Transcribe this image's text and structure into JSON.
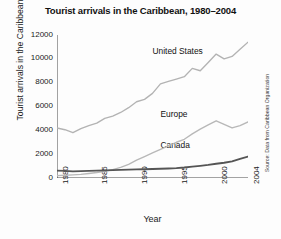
{
  "chart_data": {
    "type": "line",
    "title": "Tourist arrivals in the Caribbean, 1980–2004",
    "xlabel": "Year",
    "ylabel": "Tourist arrivals in the Caribbean",
    "source": "Source: Data from Caribbean Organization",
    "grid": false,
    "legend_position": "inline-labels",
    "xlim": [
      1980,
      2004
    ],
    "ylim": [
      0,
      12000
    ],
    "ytick_values": [
      0,
      2000,
      4000,
      6000,
      8000,
      10000,
      12000
    ],
    "ytick_labels": [
      "0",
      "2000",
      "4000",
      "6000",
      "8000",
      "10000",
      "12000"
    ],
    "xtick_labels": [
      "1980",
      "1985",
      "1990",
      "1995",
      "2000",
      "2004"
    ],
    "xtick_values": [
      1980,
      1985,
      1990,
      1995,
      2000,
      2004
    ],
    "x": [
      1980,
      1981,
      1982,
      1983,
      1984,
      1985,
      1986,
      1987,
      1988,
      1989,
      1990,
      1991,
      1992,
      1993,
      1994,
      1995,
      1996,
      1997,
      1998,
      1999,
      2000,
      2001,
      2002,
      2003,
      2004
    ],
    "series": [
      {
        "name": "United States",
        "color": "#b3b3b3",
        "values": [
          4200,
          4050,
          3800,
          4150,
          4400,
          4600,
          5000,
          5200,
          5500,
          5900,
          6400,
          6600,
          7100,
          7900,
          8100,
          8300,
          8500,
          9200,
          9000,
          9700,
          10400,
          10000,
          10200,
          10800,
          11400
        ]
      },
      {
        "name": "Europe",
        "color": "#b8b8b8",
        "values": [
          200,
          230,
          260,
          300,
          380,
          460,
          560,
          700,
          900,
          1150,
          1500,
          1800,
          2100,
          2400,
          2700,
          3000,
          3250,
          3700,
          4100,
          4450,
          4800,
          4500,
          4200,
          4400,
          4700
        ]
      },
      {
        "name": "Canada",
        "color": "#555555",
        "values": [
          620,
          600,
          560,
          580,
          600,
          620,
          640,
          660,
          680,
          700,
          720,
          740,
          760,
          780,
          800,
          830,
          880,
          950,
          1020,
          1100,
          1200,
          1280,
          1400,
          1600,
          1800
        ]
      }
    ],
    "annotations": [
      {
        "text": "United States",
        "x": 1992,
        "y": 10600
      },
      {
        "text": "Europe",
        "x": 1993,
        "y": 5300
      },
      {
        "text": "Canada",
        "x": 1993,
        "y": 2700
      }
    ]
  }
}
